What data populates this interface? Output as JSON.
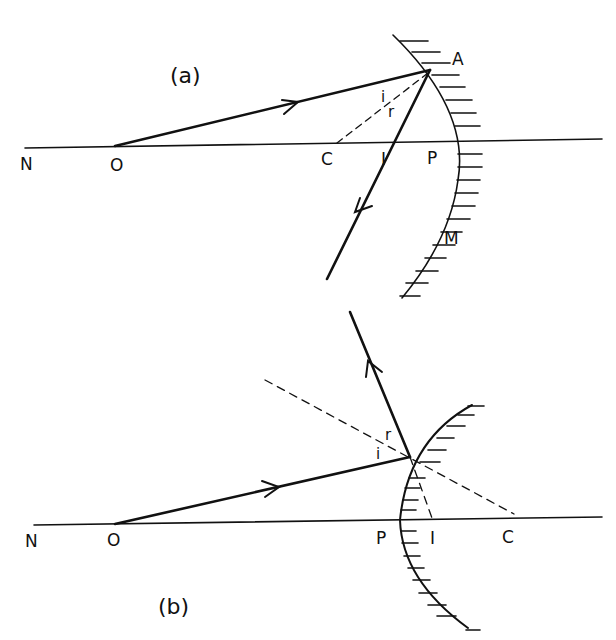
{
  "diagram_a": {
    "caption": "(a)",
    "labels": {
      "N": "N",
      "O": "O",
      "C": "C",
      "I": "I",
      "P": "P",
      "A": "A",
      "M": "M",
      "i": "i",
      "r": "r"
    },
    "mirror": "concave",
    "description": "Concave mirror: ray from object O on principal axis strikes mirror at A and reflects through image point I; dashed normal AC to centre of curvature C"
  },
  "diagram_b": {
    "caption": "(b)",
    "labels": {
      "N": "N",
      "O": "O",
      "P": "P",
      "I": "I",
      "C": "C",
      "i": "i",
      "r": "r"
    },
    "mirror": "convex",
    "description": "Convex mirror: ray from object O strikes mirror and reflects away; dashed normal through C and dashed extension to virtual image I behind mirror"
  },
  "colors": {
    "ink": "#111111",
    "background": "#ffffff"
  }
}
